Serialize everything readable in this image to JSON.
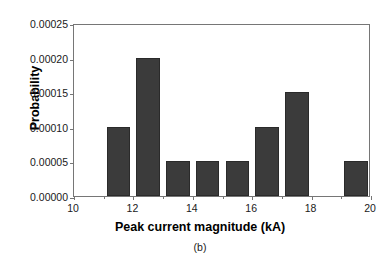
{
  "chart_data": {
    "type": "bar",
    "title": "",
    "subtitle": "",
    "xlabel": "Peak current magnitude (kA)",
    "ylabel": "Probability",
    "caption": "(b)",
    "xlim": [
      10,
      20
    ],
    "ylim": [
      0.0,
      0.00025
    ],
    "grid": false,
    "legend": null,
    "bar_color": "#3b3b3b",
    "bar_edge_color": "#2a2a2a",
    "axis_color": "#767676",
    "bin_width": 1,
    "xticks": [
      10,
      12,
      14,
      16,
      18,
      20
    ],
    "xtick_labels": [
      "10",
      "12",
      "14",
      "16",
      "18",
      "20"
    ],
    "yticks": [
      0.0,
      5e-05,
      0.0001,
      0.00015,
      0.0002,
      0.00025
    ],
    "ytick_labels": [
      "0.00000",
      "0.00005",
      "0.00010",
      "0.00015",
      "0.00020",
      "0.00025"
    ],
    "categories": [
      "10-11",
      "11-12",
      "12-13",
      "13-14",
      "14-15",
      "15-16",
      "16-17",
      "17-18",
      "18-19",
      "19-20"
    ],
    "bin_starts": [
      10,
      11,
      12,
      13,
      14,
      15,
      16,
      17,
      18,
      19
    ],
    "values": [
      0.0,
      0.0001,
      0.0002,
      5e-05,
      5e-05,
      5e-05,
      0.0001,
      0.00015,
      0.0,
      5e-05
    ],
    "bars": [
      {
        "bin_start": 11,
        "bin_end": 12,
        "value": 0.0001,
        "value_label": "0.00010"
      },
      {
        "bin_start": 12,
        "bin_end": 13,
        "value": 0.0002,
        "value_label": "0.00020"
      },
      {
        "bin_start": 13,
        "bin_end": 14,
        "value": 5e-05,
        "value_label": "0.00005"
      },
      {
        "bin_start": 14,
        "bin_end": 15,
        "value": 5e-05,
        "value_label": "0.00005"
      },
      {
        "bin_start": 15,
        "bin_end": 16,
        "value": 5e-05,
        "value_label": "0.00005"
      },
      {
        "bin_start": 16,
        "bin_end": 17,
        "value": 0.0001,
        "value_label": "0.00010"
      },
      {
        "bin_start": 17,
        "bin_end": 18,
        "value": 0.00015,
        "value_label": "0.00015"
      },
      {
        "bin_start": 19,
        "bin_end": 20,
        "value": 5e-05,
        "value_label": "0.00005"
      }
    ]
  }
}
